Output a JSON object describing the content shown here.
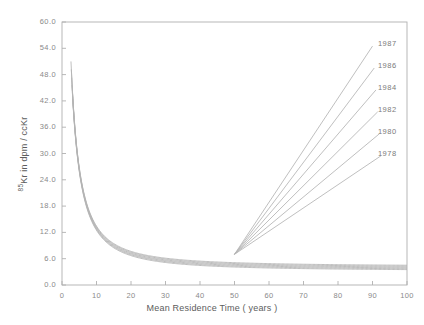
{
  "chart_data": {
    "type": "line",
    "title": "",
    "xlabel": "Mean Residence Time ( years )",
    "ylabel_prefix": "85",
    "ylabel_rest": "Kr in dpm / ccKr",
    "xlim": [
      0,
      100
    ],
    "ylim": [
      0,
      60
    ],
    "xticks": [
      0,
      10,
      20,
      30,
      40,
      50,
      60,
      70,
      80,
      90,
      100
    ],
    "xtick_labels": [
      "0",
      "10",
      "20",
      "30",
      "40",
      "50",
      "60",
      "70",
      "80",
      "90",
      "100"
    ],
    "yticks": [
      0,
      6,
      12,
      18,
      24,
      30,
      36,
      42,
      48,
      54,
      60
    ],
    "ytick_labels": [
      "0.0",
      "6.0",
      "12.0",
      "18.0",
      "24.0",
      "30.0",
      "36.0",
      "42.0",
      "48.0",
      "54.0",
      "60.0"
    ],
    "grid": false,
    "legend_position": "inline-right-end-of-line",
    "line_color": "#b4b4b4",
    "axis_color": "#b0b0b0",
    "convergence_point": {
      "x": 50,
      "y": 7.0
    },
    "series": [
      {
        "name": "1987",
        "label": "1987",
        "decay_start_y": 51.0,
        "decay_x0": 2.6,
        "ascend_end": {
          "x": 90.0,
          "y": 54.5
        },
        "label_pos": {
          "x": 91.0,
          "y": 55.0
        }
      },
      {
        "name": "1986",
        "label": "1986",
        "decay_start_y": 49.2,
        "decay_x0": 2.7,
        "ascend_end": {
          "x": 90.5,
          "y": 49.5
        },
        "label_pos": {
          "x": 91.0,
          "y": 50.0
        }
      },
      {
        "name": "1984",
        "label": "1984",
        "decay_start_y": 47.3,
        "decay_x0": 2.8,
        "ascend_end": {
          "x": 91.0,
          "y": 44.5
        },
        "label_pos": {
          "x": 91.0,
          "y": 45.0
        }
      },
      {
        "name": "1982",
        "label": "1982",
        "decay_start_y": 45.6,
        "decay_x0": 2.9,
        "ascend_end": {
          "x": 91.5,
          "y": 39.5
        },
        "label_pos": {
          "x": 91.0,
          "y": 40.0
        }
      },
      {
        "name": "1980",
        "label": "1980",
        "decay_start_y": 44.0,
        "decay_x0": 3.0,
        "ascend_end": {
          "x": 92.0,
          "y": 34.5
        },
        "label_pos": {
          "x": 91.0,
          "y": 35.0
        }
      },
      {
        "name": "1978",
        "label": "1978",
        "decay_start_y": 42.4,
        "decay_x0": 3.1,
        "ascend_end": {
          "x": 92.5,
          "y": 29.5
        },
        "label_pos": {
          "x": 91.0,
          "y": 30.0
        }
      }
    ],
    "decay_end_values": [
      4.2,
      4.0,
      3.8,
      3.6,
      3.4,
      3.2
    ]
  }
}
